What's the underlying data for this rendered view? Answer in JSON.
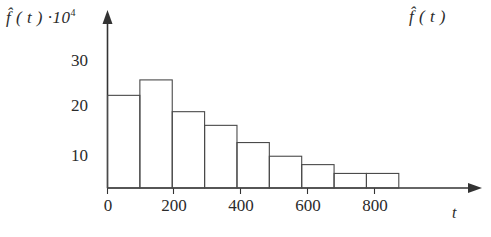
{
  "figure": {
    "y_axis_caption": "f̂ ( t ) ·10",
    "y_axis_caption_exponent": "4",
    "corner_caption": "f̂ ( t )",
    "x_axis_variable": "t"
  },
  "chart_data": {
    "type": "bar",
    "title": "",
    "subtitle": "",
    "xlabel": "t",
    "ylabel": "f̂ ( t ) ·10⁴",
    "categories": [
      "0-100",
      "100-200",
      "200-300",
      "300-400",
      "400-500",
      "500-600",
      "600-700",
      "700-800",
      "800-900"
    ],
    "bin_edges": [
      0,
      100,
      200,
      300,
      400,
      500,
      600,
      700,
      800,
      900
    ],
    "values": [
      21,
      24.5,
      17.3,
      14.2,
      10.3,
      7.2,
      5.3,
      3.3,
      3.3
    ],
    "x_ticks": [
      0,
      200,
      400,
      600,
      800
    ],
    "x_tick_labels": [
      "0",
      "200",
      "400",
      "600",
      "800"
    ],
    "y_ticks": [
      10,
      20,
      30
    ],
    "y_tick_labels": [
      "10",
      "20",
      "30"
    ],
    "xlim": [
      0,
      1120
    ],
    "ylim": [
      0,
      34
    ],
    "grid": false,
    "legend": null,
    "bar_style": "outline",
    "bar_fill": "#ffffff",
    "bar_stroke": "#4a4a4a",
    "axis_color": "#333333",
    "background": "#ffffff"
  }
}
